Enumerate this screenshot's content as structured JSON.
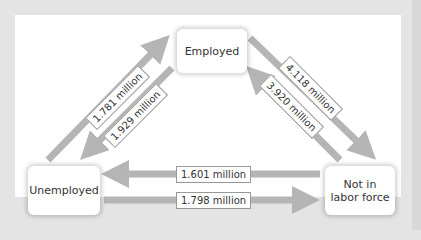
{
  "nodes": {
    "employed": "Employed",
    "unemployed": "Unemployed",
    "not_in_labor_force_line1": "Not in",
    "not_in_labor_force_line2": "labor force"
  },
  "flows": {
    "unemployed_to_employed": "1.781 million",
    "employed_to_unemployed": "1.929 million",
    "employed_to_nilf": "4.118 million",
    "nilf_to_employed": "3.920 million",
    "nilf_to_unemployed": "1.601 million",
    "unemployed_to_nilf": "1.798 million"
  },
  "colors": {
    "arrow": "#b5b5b5",
    "background": "#e4e4e4",
    "panel": "#ffffff"
  }
}
